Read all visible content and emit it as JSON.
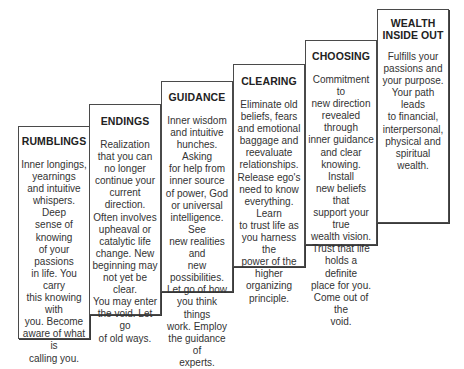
{
  "diagram": {
    "type": "staircase",
    "steps": [
      {
        "title": "RUMBLINGS",
        "body": "Inner longings,\nyearnings\nand intuitive\nwhispers. Deep\nsense of knowing\nof your passions\nin life. You carry\nthis knowing with\nyou. Become\naware of what is\ncalling you."
      },
      {
        "title": "ENDINGS",
        "body": "Realization\nthat you can\nno longer\ncontinue your\ncurrent direction.\nOften involves\nupheaval or\ncatalytic life\nchange. New\nbeginning may\nnot yet be clear.\nYou may enter\nthe void. Let go\nof old ways."
      },
      {
        "title": "GUIDANCE",
        "body": "Inner wisdom\nand intuitive\nhunches. Asking\nfor help from\ninner source\nof power, God\nor universal\nintelligence. See\nnew realities and\nnew possibilities.\nLet go of how\nyou think things\nwork. Employ\nthe guidance of\nexperts."
      },
      {
        "title": "CLEARING",
        "body": "Eliminate old\nbeliefs, fears\nand emotional\nbaggage and\nreevaluate\nrelationships.\nRelease ego's\nneed to know\neverything. Learn\nto trust life as\nyou harness the\npower of the\nhigher organizing\nprinciple."
      },
      {
        "title": "CHOOSING",
        "body": "Commitment to\nnew direction\nrevealed through\ninner guidance\nand clear\nknowing. Install\nnew beliefs that\nsupport your true\nwealth vision.\nTrust that life\nholds a definite\nplace for you.\nCome out of the\nvoid."
      },
      {
        "title": "WEALTH\nINSIDE OUT",
        "body": "Fulfills your\npassions and\nyour purpose.\nYour path leads\nto financial,\ninterpersonal,\nphysical and\nspiritual wealth."
      }
    ],
    "colors": {
      "border": "#4a4a4a",
      "background": "#ffffff",
      "text": "#333333"
    }
  }
}
